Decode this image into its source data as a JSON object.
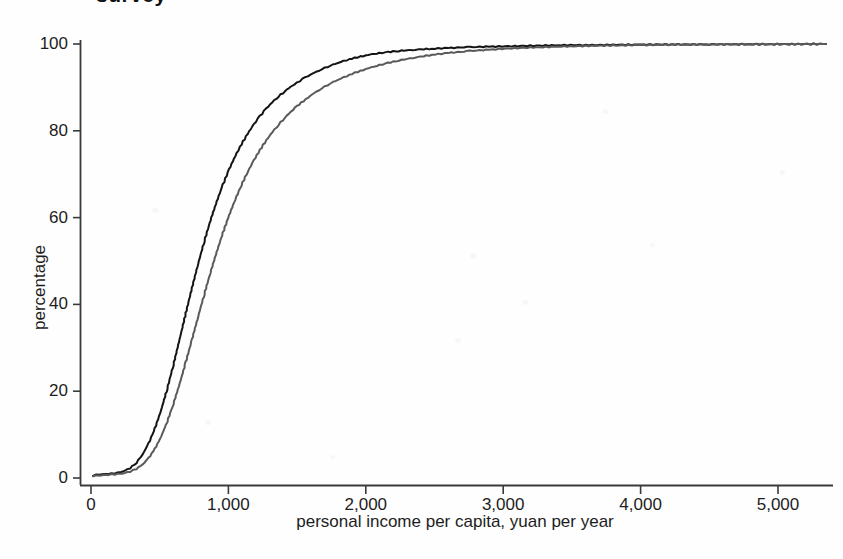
{
  "figure": {
    "title_remnant": "survey",
    "background_color": "#fefefe"
  },
  "axes": {
    "y_title": "percentage",
    "x_title": "personal income per capita, yuan per year",
    "y_ticks": [
      "0",
      "20",
      "40",
      "60",
      "80",
      "100"
    ],
    "x_ticks": [
      "0",
      "1,000",
      "2,000",
      "3,000",
      "4,000",
      "5,000"
    ],
    "axis_color": "#3a3a3a"
  },
  "chart_data": {
    "type": "line",
    "title": "survey",
    "xlabel": "personal income per capita, yuan per year",
    "ylabel": "percentage",
    "xlim": [
      0,
      5400
    ],
    "ylim": [
      0,
      100
    ],
    "xticks": [
      0,
      1000,
      2000,
      3000,
      4000,
      5000
    ],
    "yticks": [
      0,
      20,
      40,
      60,
      80,
      100
    ],
    "xtick_labels": [
      "0",
      "1,000",
      "2,000",
      "3,000",
      "4,000",
      "5,000"
    ],
    "ytick_labels": [
      "0",
      "20",
      "40",
      "60",
      "80",
      "100"
    ],
    "grid": false,
    "legend": null,
    "series": [
      {
        "name": "black-curve",
        "color": "#141414",
        "linewidth": 2.0,
        "x": [
          15,
          60,
          105,
          150,
          195,
          240,
          285,
          330,
          375,
          420,
          465,
          510,
          555,
          600,
          645,
          690,
          735,
          780,
          825,
          870,
          915,
          960,
          1005,
          1050,
          1095,
          1140,
          1185,
          1230,
          1275,
          1320,
          1365,
          1410,
          1455,
          1500,
          1560,
          1620,
          1680,
          1740,
          1800,
          1880,
          1960,
          2040,
          2140,
          2240,
          2360,
          2480,
          2620,
          2760,
          2900,
          3060,
          3220,
          3400,
          3600,
          3800,
          4000,
          4250,
          4500,
          4800,
          5100,
          5350
        ],
        "y": [
          0.6,
          0.8,
          0.9,
          1.0,
          1.2,
          1.6,
          2.3,
          3.5,
          5.4,
          8.0,
          11.4,
          15.6,
          20.6,
          26.1,
          32.0,
          38.0,
          43.8,
          49.4,
          54.6,
          59.4,
          63.7,
          67.6,
          71.1,
          74.2,
          76.9,
          79.3,
          81.5,
          83.4,
          85.1,
          86.6,
          87.9,
          89.1,
          90.2,
          91.1,
          92.3,
          93.3,
          94.2,
          95.0,
          95.7,
          96.5,
          97.1,
          97.6,
          98.1,
          98.4,
          98.7,
          98.9,
          99.1,
          99.3,
          99.4,
          99.5,
          99.6,
          99.7,
          99.75,
          99.8,
          99.85,
          99.9,
          99.92,
          99.95,
          99.97,
          100.0
        ]
      },
      {
        "name": "gray-curve",
        "color": "#5a5a5a",
        "linewidth": 2.0,
        "x": [
          15,
          60,
          105,
          150,
          195,
          240,
          285,
          330,
          375,
          420,
          465,
          510,
          555,
          600,
          645,
          690,
          735,
          780,
          825,
          870,
          915,
          960,
          1005,
          1050,
          1095,
          1140,
          1185,
          1230,
          1275,
          1320,
          1365,
          1410,
          1455,
          1500,
          1560,
          1620,
          1680,
          1740,
          1800,
          1880,
          1960,
          2040,
          2140,
          2240,
          2360,
          2480,
          2620,
          2760,
          2900,
          3060,
          3220,
          3400,
          3600,
          3800,
          4000,
          4250,
          4500,
          4800,
          5100,
          5350
        ],
        "y": [
          0.5,
          0.6,
          0.7,
          0.8,
          0.9,
          1.1,
          1.5,
          2.1,
          3.1,
          4.6,
          6.7,
          9.5,
          13.0,
          17.1,
          21.7,
          26.7,
          31.9,
          37.2,
          42.4,
          47.4,
          52.1,
          56.5,
          60.5,
          64.2,
          67.5,
          70.5,
          73.2,
          75.6,
          77.8,
          79.7,
          81.4,
          83.0,
          84.4,
          85.7,
          87.2,
          88.6,
          89.8,
          90.9,
          91.8,
          92.9,
          93.8,
          94.6,
          95.5,
          96.2,
          96.9,
          97.5,
          98.0,
          98.4,
          98.7,
          99.0,
          99.2,
          99.4,
          99.55,
          99.65,
          99.75,
          99.85,
          99.9,
          99.93,
          99.96,
          100.0
        ]
      }
    ]
  }
}
